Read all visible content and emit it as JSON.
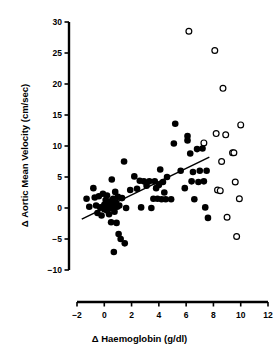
{
  "chart_data": {
    "type": "scatter",
    "title": "",
    "xlabel": "Δ Haemoglobin (g/dl)",
    "ylabel": "Δ Aortic Mean Velocity (cm/sec)",
    "xlim": [
      -2,
      12
    ],
    "ylim": [
      -10,
      30
    ],
    "xticks": [
      -2,
      0,
      2,
      4,
      6,
      8,
      10,
      12
    ],
    "yticks": [
      -10,
      -5,
      0,
      5,
      10,
      15,
      20,
      25,
      30
    ],
    "xtick_labels": [
      "−2",
      "0",
      "2",
      "4",
      "6",
      "8",
      "10",
      "12"
    ],
    "ytick_labels": [
      "−10",
      "−5",
      "0",
      "5",
      "10",
      "15",
      "20",
      "25",
      "30"
    ],
    "grid": false,
    "legend": null,
    "series": [
      {
        "name": "filled",
        "marker": "filled-circle",
        "color": "#000000",
        "points": [
          [
            -1.3,
            1.5
          ],
          [
            -1.1,
            0.2
          ],
          [
            -0.8,
            3.2
          ],
          [
            -0.7,
            1.7
          ],
          [
            -0.6,
            0.4
          ],
          [
            -0.5,
            -0.8
          ],
          [
            -0.4,
            1.9
          ],
          [
            -0.3,
            0.1
          ],
          [
            -0.2,
            -1.2
          ],
          [
            -0.1,
            2.3
          ],
          [
            0.0,
            0.5
          ],
          [
            0.0,
            -0.2
          ],
          [
            0.1,
            1.3
          ],
          [
            0.2,
            -0.4
          ],
          [
            0.2,
            2.0
          ],
          [
            0.3,
            0.8
          ],
          [
            0.35,
            -1.0
          ],
          [
            0.4,
            0.0
          ],
          [
            0.45,
            1.1
          ],
          [
            0.5,
            -2.3
          ],
          [
            0.5,
            0.6
          ],
          [
            0.55,
            4.6
          ],
          [
            0.6,
            -0.1
          ],
          [
            0.65,
            1.5
          ],
          [
            0.7,
            0.3
          ],
          [
            0.7,
            -7.1
          ],
          [
            0.75,
            -0.6
          ],
          [
            0.8,
            2.6
          ],
          [
            0.85,
            0.9
          ],
          [
            0.9,
            -2.4
          ],
          [
            0.95,
            0.2
          ],
          [
            1.0,
            1.8
          ],
          [
            1.05,
            -4.2
          ],
          [
            1.1,
            0.4
          ],
          [
            1.2,
            -5.0
          ],
          [
            1.3,
            1.6
          ],
          [
            1.45,
            7.5
          ],
          [
            1.5,
            -5.7
          ],
          [
            1.6,
            0.0
          ],
          [
            1.9,
            2.9
          ],
          [
            2.2,
            5.1
          ],
          [
            2.4,
            3.1
          ],
          [
            2.6,
            4.4
          ],
          [
            2.7,
            0.1
          ],
          [
            2.9,
            4.3
          ],
          [
            3.1,
            3.6
          ],
          [
            3.3,
            4.3
          ],
          [
            3.45,
            0.0
          ],
          [
            3.6,
            1.5
          ],
          [
            3.7,
            4.3
          ],
          [
            3.8,
            3.2
          ],
          [
            3.9,
            1.5
          ],
          [
            4.0,
            3.7
          ],
          [
            4.1,
            6.2
          ],
          [
            4.2,
            1.4
          ],
          [
            4.3,
            4.2
          ],
          [
            4.4,
            2.5
          ],
          [
            4.5,
            1.4
          ],
          [
            4.6,
            5.0
          ],
          [
            4.9,
            1.4
          ],
          [
            5.1,
            10.4
          ],
          [
            5.2,
            13.6
          ],
          [
            5.6,
            6.0
          ],
          [
            5.9,
            3.2
          ],
          [
            6.1,
            11.6
          ],
          [
            6.1,
            10.9
          ],
          [
            6.3,
            8.8
          ],
          [
            6.4,
            4.3
          ],
          [
            6.5,
            5.8
          ],
          [
            6.6,
            1.4
          ],
          [
            6.8,
            9.5
          ],
          [
            6.9,
            4.2
          ],
          [
            7.0,
            6.0
          ],
          [
            7.2,
            9.6
          ],
          [
            7.3,
            4.3
          ],
          [
            7.4,
            0.1
          ],
          [
            7.5,
            6.0
          ],
          [
            7.6,
            -1.6
          ]
        ]
      },
      {
        "name": "open",
        "marker": "open-circle",
        "color": "#000000",
        "points": [
          [
            6.2,
            28.5
          ],
          [
            7.3,
            10.5
          ],
          [
            8.1,
            25.4
          ],
          [
            8.2,
            12.0
          ],
          [
            8.3,
            2.9
          ],
          [
            8.5,
            2.8
          ],
          [
            8.6,
            7.5
          ],
          [
            8.7,
            19.3
          ],
          [
            8.9,
            11.8
          ],
          [
            9.0,
            -1.5
          ],
          [
            9.4,
            8.9
          ],
          [
            9.5,
            8.9
          ],
          [
            9.6,
            4.2
          ],
          [
            9.7,
            -4.6
          ],
          [
            9.9,
            1.5
          ],
          [
            10.0,
            13.4
          ]
        ]
      }
    ],
    "fit_line": {
      "name": "regression-line",
      "x0": -1.65,
      "y0": -1.8,
      "x1": 7.7,
      "y1": 8.2,
      "color": "#000000"
    }
  }
}
